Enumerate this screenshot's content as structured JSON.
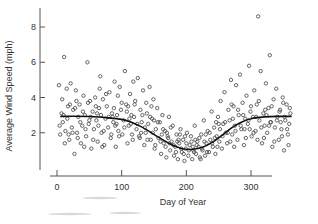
{
  "chart_data": {
    "type": "scatter",
    "title": "",
    "xlabel": "Day of Year",
    "ylabel": "Average Wind Speed (mph)",
    "xlim": [
      -8,
      375
    ],
    "ylim": [
      0,
      9
    ],
    "xticks": [
      0,
      100,
      200,
      300
    ],
    "yticks": [
      2,
      4,
      6,
      8
    ],
    "grid": false,
    "legend": null,
    "series": [
      {
        "name": "Daily average wind speed",
        "marker": "open-circle",
        "points": [
          [
            3,
            4.7
          ],
          [
            5,
            1.9
          ],
          [
            7,
            3.1
          ],
          [
            9,
            2.6
          ],
          [
            11,
            6.3
          ],
          [
            13,
            2.1
          ],
          [
            15,
            4.5
          ],
          [
            17,
            3.5
          ],
          [
            19,
            1.6
          ],
          [
            21,
            4.8
          ],
          [
            23,
            2.3
          ],
          [
            25,
            3.3
          ],
          [
            27,
            0.8
          ],
          [
            29,
            4.4
          ],
          [
            31,
            2.0
          ],
          [
            33,
            2.9
          ],
          [
            35,
            3.6
          ],
          [
            37,
            1.4
          ],
          [
            39,
            2.4
          ],
          [
            41,
            4.1
          ],
          [
            43,
            3.0
          ],
          [
            45,
            1.8
          ],
          [
            47,
            6.0
          ],
          [
            49,
            2.5
          ],
          [
            51,
            3.8
          ],
          [
            53,
            1.1
          ],
          [
            55,
            3.2
          ],
          [
            57,
            2.2
          ],
          [
            59,
            4.0
          ],
          [
            61,
            2.7
          ],
          [
            63,
            1.5
          ],
          [
            65,
            3.4
          ],
          [
            67,
            5.2
          ],
          [
            69,
            2.0
          ],
          [
            71,
            3.9
          ],
          [
            73,
            1.3
          ],
          [
            75,
            2.8
          ],
          [
            77,
            3.5
          ],
          [
            79,
            2.3
          ],
          [
            81,
            4.3
          ],
          [
            83,
            1.7
          ],
          [
            85,
            3.1
          ],
          [
            87,
            2.6
          ],
          [
            89,
            4.9
          ],
          [
            91,
            1.2
          ],
          [
            93,
            3.0
          ],
          [
            95,
            2.1
          ],
          [
            97,
            4.6
          ],
          [
            99,
            3.3
          ],
          [
            101,
            1.9
          ],
          [
            103,
            2.7
          ],
          [
            105,
            5.5
          ],
          [
            107,
            3.6
          ],
          [
            109,
            1.4
          ],
          [
            111,
            2.4
          ],
          [
            113,
            4.2
          ],
          [
            115,
            3.0
          ],
          [
            117,
            1.6
          ],
          [
            119,
            2.9
          ],
          [
            121,
            3.8
          ],
          [
            123,
            2.2
          ],
          [
            125,
            5.1
          ],
          [
            127,
            1.8
          ],
          [
            129,
            3.3
          ],
          [
            131,
            2.6
          ],
          [
            133,
            4.4
          ],
          [
            135,
            1.3
          ],
          [
            137,
            2.0
          ],
          [
            139,
            3.1
          ],
          [
            141,
            2.5
          ],
          [
            143,
            4.6
          ],
          [
            145,
            1.6
          ],
          [
            147,
            2.8
          ],
          [
            149,
            3.9
          ],
          [
            151,
            1.1
          ],
          [
            153,
            2.2
          ],
          [
            155,
            3.4
          ],
          [
            157,
            1.7
          ],
          [
            159,
            2.6
          ],
          [
            161,
            0.8
          ],
          [
            163,
            3.0
          ],
          [
            165,
            1.4
          ],
          [
            167,
            2.1
          ],
          [
            169,
            0.6
          ],
          [
            171,
            1.8
          ],
          [
            173,
            2.9
          ],
          [
            175,
            1.0
          ],
          [
            177,
            1.5
          ],
          [
            179,
            2.4
          ],
          [
            181,
            0.7
          ],
          [
            183,
            1.2
          ],
          [
            185,
            1.9
          ],
          [
            187,
            0.5
          ],
          [
            189,
            1.4
          ],
          [
            191,
            2.2
          ],
          [
            193,
            0.9
          ],
          [
            195,
            1.6
          ],
          [
            197,
            0.4
          ],
          [
            199,
            1.1
          ],
          [
            201,
            2.0
          ],
          [
            203,
            0.7
          ],
          [
            205,
            1.3
          ],
          [
            207,
            1.8
          ],
          [
            209,
            0.5
          ],
          [
            211,
            1.0
          ],
          [
            213,
            2.4
          ],
          [
            215,
            0.8
          ],
          [
            217,
            1.5
          ],
          [
            219,
            1.2
          ],
          [
            221,
            0.6
          ],
          [
            223,
            1.9
          ],
          [
            225,
            1.0
          ],
          [
            227,
            2.7
          ],
          [
            229,
            0.7
          ],
          [
            231,
            1.4
          ],
          [
            233,
            2.1
          ],
          [
            235,
            0.9
          ],
          [
            237,
            1.6
          ],
          [
            239,
            3.2
          ],
          [
            241,
            1.2
          ],
          [
            243,
            2.3
          ],
          [
            245,
            0.8
          ],
          [
            247,
            1.8
          ],
          [
            249,
            2.9
          ],
          [
            251,
            1.5
          ],
          [
            253,
            3.8
          ],
          [
            255,
            1.1
          ],
          [
            257,
            2.5
          ],
          [
            259,
            4.3
          ],
          [
            261,
            2.0
          ],
          [
            263,
            1.4
          ],
          [
            265,
            3.3
          ],
          [
            267,
            2.7
          ],
          [
            269,
            5.0
          ],
          [
            271,
            1.9
          ],
          [
            273,
            3.5
          ],
          [
            275,
            2.4
          ],
          [
            277,
            4.7
          ],
          [
            279,
            1.6
          ],
          [
            281,
            3.0
          ],
          [
            283,
            5.3
          ],
          [
            285,
            2.2
          ],
          [
            287,
            3.7
          ],
          [
            289,
            1.3
          ],
          [
            291,
            2.8
          ],
          [
            293,
            4.1
          ],
          [
            295,
            2.5
          ],
          [
            297,
            5.8
          ],
          [
            299,
            3.2
          ],
          [
            301,
            1.8
          ],
          [
            303,
            2.9
          ],
          [
            305,
            4.4
          ],
          [
            307,
            2.1
          ],
          [
            309,
            3.6
          ],
          [
            311,
            8.6
          ],
          [
            313,
            2.7
          ],
          [
            315,
            5.5
          ],
          [
            317,
            1.4
          ],
          [
            319,
            3.1
          ],
          [
            321,
            2.4
          ],
          [
            323,
            4.8
          ],
          [
            325,
            2.0
          ],
          [
            327,
            3.4
          ],
          [
            329,
            6.4
          ],
          [
            331,
            2.6
          ],
          [
            333,
            1.2
          ],
          [
            335,
            3.9
          ],
          [
            337,
            2.3
          ],
          [
            339,
            4.5
          ],
          [
            341,
            2.9
          ],
          [
            343,
            1.6
          ],
          [
            345,
            3.3
          ],
          [
            347,
            2.2
          ],
          [
            349,
            4.0
          ],
          [
            351,
            1.0
          ],
          [
            353,
            2.7
          ],
          [
            355,
            3.6
          ],
          [
            357,
            1.9
          ],
          [
            359,
            2.5
          ],
          [
            361,
            3.1
          ],
          [
            4,
            2.4
          ],
          [
            8,
            3.9
          ],
          [
            12,
            1.4
          ],
          [
            16,
            2.8
          ],
          [
            20,
            3.6
          ],
          [
            24,
            2.0
          ],
          [
            28,
            3.4
          ],
          [
            32,
            1.7
          ],
          [
            36,
            2.6
          ],
          [
            40,
            3.2
          ],
          [
            44,
            2.2
          ],
          [
            48,
            3.7
          ],
          [
            52,
            2.9
          ],
          [
            56,
            1.6
          ],
          [
            60,
            3.5
          ],
          [
            64,
            2.4
          ],
          [
            68,
            3.0
          ],
          [
            72,
            2.1
          ],
          [
            76,
            4.2
          ],
          [
            80,
            2.9
          ],
          [
            84,
            1.9
          ],
          [
            88,
            3.4
          ],
          [
            92,
            2.5
          ],
          [
            96,
            1.8
          ],
          [
            100,
            3.7
          ],
          [
            104,
            2.3
          ],
          [
            108,
            3.2
          ],
          [
            112,
            2.8
          ],
          [
            116,
            1.9
          ],
          [
            120,
            3.6
          ],
          [
            124,
            2.5
          ],
          [
            128,
            1.7
          ],
          [
            132,
            3.0
          ],
          [
            136,
            2.3
          ],
          [
            140,
            1.6
          ],
          [
            144,
            2.9
          ],
          [
            148,
            2.0
          ],
          [
            152,
            1.3
          ],
          [
            156,
            2.6
          ],
          [
            160,
            1.5
          ],
          [
            164,
            2.2
          ],
          [
            168,
            1.2
          ],
          [
            172,
            1.7
          ],
          [
            176,
            2.3
          ],
          [
            180,
            1.3
          ],
          [
            184,
            0.9
          ],
          [
            188,
            1.6
          ],
          [
            192,
            1.1
          ],
          [
            196,
            0.8
          ],
          [
            200,
            1.4
          ],
          [
            204,
            1.0
          ],
          [
            208,
            1.5
          ],
          [
            212,
            0.9
          ],
          [
            216,
            1.3
          ],
          [
            220,
            1.7
          ],
          [
            224,
            1.1
          ],
          [
            228,
            1.5
          ],
          [
            232,
            0.9
          ],
          [
            236,
            2.0
          ],
          [
            240,
            1.4
          ],
          [
            244,
            1.7
          ],
          [
            248,
            1.2
          ],
          [
            252,
            2.2
          ],
          [
            256,
            1.8
          ],
          [
            260,
            2.6
          ],
          [
            264,
            2.0
          ],
          [
            268,
            1.5
          ],
          [
            272,
            2.8
          ],
          [
            276,
            2.1
          ],
          [
            280,
            3.3
          ],
          [
            284,
            2.4
          ],
          [
            288,
            3.0
          ],
          [
            292,
            1.7
          ],
          [
            296,
            2.7
          ],
          [
            300,
            3.5
          ],
          [
            304,
            2.0
          ],
          [
            308,
            2.9
          ],
          [
            312,
            3.8
          ],
          [
            316,
            2.3
          ],
          [
            320,
            1.7
          ],
          [
            324,
            3.0
          ],
          [
            328,
            2.4
          ],
          [
            332,
            3.5
          ],
          [
            336,
            1.5
          ],
          [
            340,
            2.7
          ],
          [
            344,
            3.2
          ],
          [
            348,
            1.8
          ],
          [
            352,
            2.9
          ],
          [
            356,
            2.2
          ],
          [
            360,
            3.4
          ],
          [
            10,
            3.0
          ],
          [
            30,
            3.8
          ],
          [
            50,
            2.7
          ],
          [
            70,
            1.2
          ],
          [
            90,
            2.4
          ],
          [
            110,
            3.5
          ],
          [
            130,
            2.0
          ],
          [
            150,
            2.7
          ],
          [
            170,
            2.0
          ],
          [
            190,
            1.9
          ],
          [
            210,
            1.2
          ],
          [
            230,
            1.9
          ],
          [
            250,
            2.5
          ],
          [
            270,
            3.6
          ],
          [
            290,
            2.2
          ],
          [
            310,
            1.6
          ],
          [
            330,
            2.6
          ],
          [
            350,
            3.7
          ],
          [
            18,
            1.9
          ],
          [
            42,
            1.2
          ],
          [
            66,
            4.5
          ],
          [
            94,
            4.1
          ],
          [
            118,
            4.9
          ],
          [
            146,
            3.5
          ],
          [
            174,
            1.4
          ],
          [
            198,
            1.8
          ],
          [
            222,
            0.5
          ],
          [
            246,
            2.6
          ],
          [
            274,
            1.2
          ],
          [
            298,
            2.2
          ],
          [
            322,
            3.3
          ],
          [
            346,
            2.6
          ],
          [
            358,
            1.3
          ],
          [
            62,
            3.1
          ],
          [
            86,
            2.9
          ],
          [
            114,
            2.5
          ],
          [
            138,
            3.7
          ],
          [
            162,
            1.9
          ],
          [
            186,
            1.5
          ],
          [
            214,
            1.6
          ]
        ]
      },
      {
        "name": "Smooth trend",
        "type": "line",
        "points": [
          [
            5,
            2.92
          ],
          [
            25,
            2.94
          ],
          [
            50,
            2.92
          ],
          [
            75,
            2.86
          ],
          [
            100,
            2.76
          ],
          [
            115,
            2.6
          ],
          [
            130,
            2.35
          ],
          [
            145,
            2.02
          ],
          [
            160,
            1.68
          ],
          [
            175,
            1.36
          ],
          [
            190,
            1.14
          ],
          [
            200,
            1.06
          ],
          [
            210,
            1.06
          ],
          [
            225,
            1.18
          ],
          [
            240,
            1.45
          ],
          [
            255,
            1.85
          ],
          [
            270,
            2.28
          ],
          [
            285,
            2.6
          ],
          [
            300,
            2.8
          ],
          [
            320,
            2.9
          ],
          [
            340,
            2.93
          ],
          [
            363,
            2.93
          ]
        ]
      }
    ]
  }
}
